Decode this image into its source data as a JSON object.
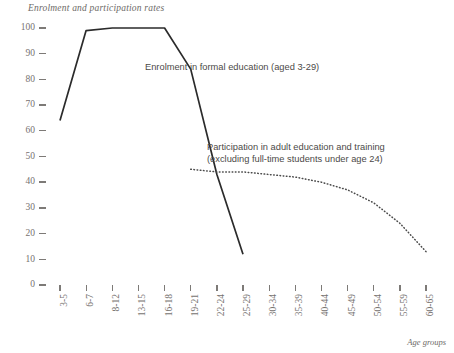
{
  "chart_data": {
    "type": "line",
    "title": "Enrolment and participation rates",
    "xlabel": "Age groups",
    "ylabel": "",
    "ylim": [
      0,
      100
    ],
    "yticks": [
      0,
      10,
      20,
      30,
      40,
      50,
      60,
      70,
      80,
      90,
      100
    ],
    "grid": false,
    "legend_position": "inline-annotations",
    "categories": [
      "3-5",
      "6-7",
      "8-12",
      "13-15",
      "16-18",
      "19-21",
      "22-24",
      "25-29",
      "30-34",
      "35-39",
      "40-44",
      "45-49",
      "50-54",
      "55-59",
      "60-65"
    ],
    "series": [
      {
        "name": "Enrolment in formal education (aged 3-29)",
        "style": "solid",
        "color": "#2b2b2b",
        "annotation": "Enrolment in formal education (aged 3-29)",
        "values": [
          64,
          99,
          100,
          100,
          100,
          84,
          43,
          12,
          null,
          null,
          null,
          null,
          null,
          null,
          null
        ]
      },
      {
        "name": "Participation in adult education and training (excluding full-time students under age 24)",
        "style": "dotted",
        "color": "#4a4a4a",
        "annotation": "Participation in adult education and training\n(excluding full-time students under age 24)",
        "values": [
          null,
          null,
          null,
          null,
          null,
          45,
          44,
          44,
          43,
          42,
          40,
          37,
          32,
          24,
          13
        ]
      }
    ]
  },
  "axis": {
    "y_tick_labels": [
      "0",
      "10",
      "20",
      "30",
      "40",
      "50",
      "60",
      "70",
      "80",
      "90",
      "100"
    ],
    "x_tick_labels": [
      "3-5",
      "6-7",
      "8-12",
      "13-15",
      "16-18",
      "19-21",
      "22-24",
      "25-29",
      "30-34",
      "35-39",
      "40-44",
      "45-49",
      "50-54",
      "55-59",
      "60-65"
    ],
    "x_axis_title": "Age groups"
  },
  "annotations": {
    "enrolment": "Enrolment in formal education (aged 3-29)",
    "participation": "Participation in adult education and training\n(excluding full-time students under age 24)"
  },
  "colors": {
    "text": "#6d6a67",
    "tick": "#7d7a77",
    "solid_line": "#2b2b2b",
    "dotted_line": "#4a4a4a",
    "background": "#ffffff"
  }
}
